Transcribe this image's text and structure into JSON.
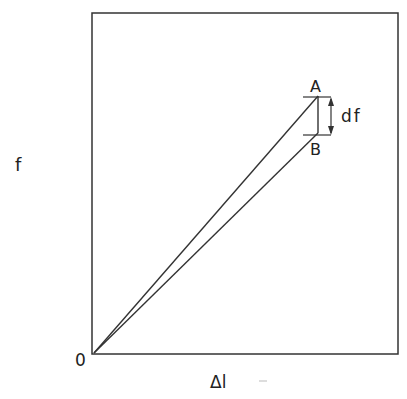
{
  "diagram": {
    "type": "force-extension plot",
    "y_axis_label": "f",
    "x_axis_label": "Δl",
    "origin_label": "0",
    "point_a_label": "A",
    "point_b_label": "B",
    "difference_label": "df",
    "line_color": "#333333"
  }
}
